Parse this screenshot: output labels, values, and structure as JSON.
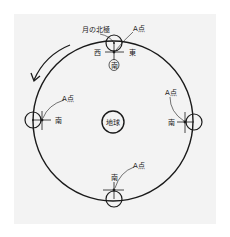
{
  "diagram": {
    "type": "moon-orbit-around-earth",
    "center_label": "地球",
    "orbit_direction": "counterclockwise",
    "moons": [
      {
        "position": "top",
        "pole_label": "月の北極",
        "point_label": "A点",
        "west_label": "西",
        "east_label": "東",
        "south_label": "南",
        "south_circled": true
      },
      {
        "position": "left",
        "point_label": "A点",
        "south_label": "南"
      },
      {
        "position": "right",
        "point_label": "A点",
        "south_label": "南"
      },
      {
        "position": "bottom",
        "point_label": "A点",
        "south_label": "南"
      }
    ]
  },
  "colors": {
    "background": "#f3f3f3",
    "line": "#1a1a1a"
  }
}
